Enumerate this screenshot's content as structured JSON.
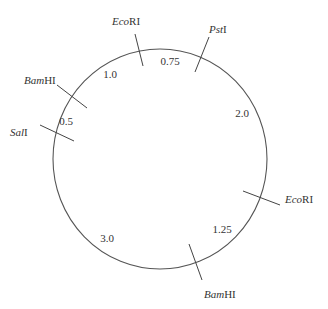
{
  "diagram": {
    "type": "circular restriction map",
    "circle": {
      "cx": 160,
      "cy": 159,
      "rx": 107,
      "ry": 110,
      "stroke": "#555555"
    },
    "sites": [
      {
        "id": "ecori-top",
        "enzyme_italic": "Eco",
        "enzyme_roman": "RI",
        "tick": [
          135,
          34,
          143,
          66
        ],
        "label_x": 112,
        "label_y": 25
      },
      {
        "id": "psti",
        "enzyme_italic": "Pst",
        "enzyme_roman": "I",
        "tick": [
          209,
          37,
          195,
          72
        ],
        "label_x": 209,
        "label_y": 33
      },
      {
        "id": "ecori-right",
        "enzyme_italic": "Eco",
        "enzyme_roman": "RI",
        "tick": [
          243,
          191,
          280,
          205
        ],
        "label_x": 285,
        "label_y": 203
      },
      {
        "id": "bamhi-bottom",
        "enzyme_italic": "Bam",
        "enzyme_roman": "HI",
        "tick": [
          189,
          244,
          202,
          280
        ],
        "label_x": 204,
        "label_y": 298
      },
      {
        "id": "sali",
        "enzyme_italic": "Sal",
        "enzyme_roman": "I",
        "tick": [
          40,
          125,
          74,
          141
        ],
        "label_x": 10,
        "label_y": 136
      },
      {
        "id": "bamhi-left",
        "enzyme_italic": "Bam",
        "enzyme_roman": "HI",
        "tick": [
          57,
          85,
          87,
          108
        ],
        "label_x": 24,
        "label_y": 84
      }
    ],
    "fragments": [
      {
        "label": "0.75",
        "x": 170,
        "y": 65
      },
      {
        "label": "2.0",
        "x": 242,
        "y": 117
      },
      {
        "label": "1.25",
        "x": 222,
        "y": 233
      },
      {
        "label": "3.0",
        "x": 107,
        "y": 242
      },
      {
        "label": "0.5",
        "x": 66,
        "y": 125
      },
      {
        "label": "1.0",
        "x": 110,
        "y": 78
      }
    ]
  }
}
